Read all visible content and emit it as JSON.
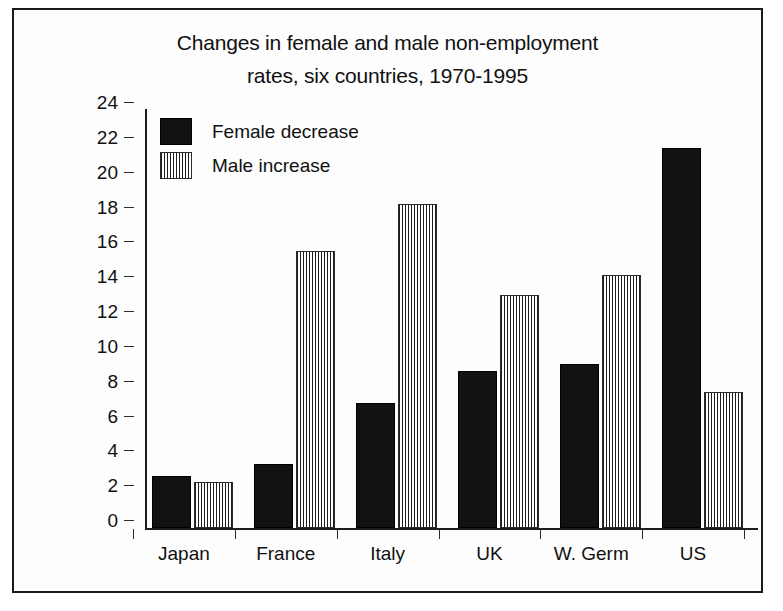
{
  "chart_data": {
    "type": "bar",
    "title": "Changes in female and male non-employment rates, six countries, 1970-1995",
    "title_lines": [
      "Changes in female and male non-employment",
      "rates, six countries, 1970-1995"
    ],
    "xlabel": "",
    "ylabel": "",
    "ylim": [
      0,
      24
    ],
    "ytick_step": 2,
    "yticks": [
      0,
      2,
      4,
      6,
      8,
      10,
      12,
      14,
      16,
      18,
      20,
      22,
      24
    ],
    "ytick_labels": [
      "0",
      "2",
      "4",
      "6",
      "8",
      "10",
      "12",
      "14",
      "16",
      "18",
      "20",
      "22",
      "24"
    ],
    "grid": false,
    "legend_position": "upper-left-inside",
    "categories": [
      "Japan",
      "France",
      "Italy",
      "UK",
      "W. Germ",
      "US"
    ],
    "series": [
      {
        "name": "Female decrease",
        "fill": "solid-black",
        "color": "#121212",
        "values": [
          3.0,
          3.7,
          7.2,
          9.0,
          9.4,
          21.8
        ]
      },
      {
        "name": "Male increase",
        "fill": "vertical-hatch-gray",
        "color": "#9a9a9a",
        "values": [
          2.65,
          15.9,
          18.6,
          13.4,
          14.5,
          7.8
        ]
      }
    ]
  },
  "legend": {
    "items": [
      {
        "label": "Female decrease",
        "swatch": "solid-black-swatch"
      },
      {
        "label": "Male increase",
        "swatch": "hatched-gray-swatch"
      }
    ]
  },
  "colors": {
    "female_bar": "#121212",
    "male_bar": "#9a9a9a",
    "axis": "#1d1d1d",
    "frame": "#1a1a1a",
    "text": "#111111",
    "background": "#ffffff"
  }
}
